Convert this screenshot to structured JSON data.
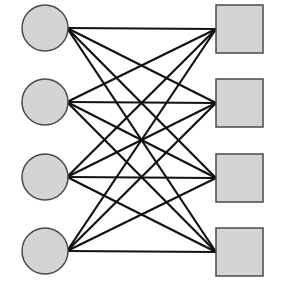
{
  "diagram": {
    "type": "complete-bipartite-graph",
    "colors": {
      "background": "#ffffff",
      "node_fill": "#d4d4d4",
      "node_stroke": "#4a4a4a",
      "edge": "#111111"
    },
    "left_nodes": [
      {
        "id": "c1",
        "shape": "circle",
        "cx": 45,
        "cy": 28,
        "r": 23
      },
      {
        "id": "c2",
        "shape": "circle",
        "cx": 45,
        "cy": 102,
        "r": 23
      },
      {
        "id": "c3",
        "shape": "circle",
        "cx": 45,
        "cy": 177,
        "r": 23
      },
      {
        "id": "c4",
        "shape": "circle",
        "cx": 45,
        "cy": 251,
        "r": 23
      }
    ],
    "right_nodes": [
      {
        "id": "s1",
        "shape": "square",
        "x": 216,
        "y": 5,
        "w": 47,
        "h": 48
      },
      {
        "id": "s2",
        "shape": "square",
        "x": 216,
        "y": 79,
        "w": 47,
        "h": 48
      },
      {
        "id": "s3",
        "shape": "square",
        "x": 216,
        "y": 154,
        "w": 47,
        "h": 48
      },
      {
        "id": "s4",
        "shape": "square",
        "x": 216,
        "y": 228,
        "w": 47,
        "h": 48
      }
    ],
    "edges": "all-left-to-all-right"
  }
}
